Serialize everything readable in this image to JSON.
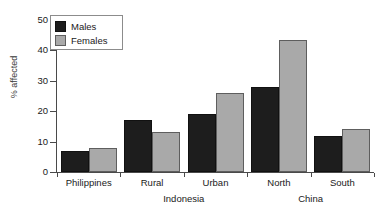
{
  "chart_data": {
    "type": "bar",
    "title": "",
    "xlabel": "",
    "ylabel": "% affected",
    "ylim": [
      0,
      50
    ],
    "yticks": [
      0,
      10,
      20,
      30,
      40,
      50
    ],
    "grid": false,
    "legend_position": "top-left",
    "categories": [
      "Philippines",
      "Rural",
      "Urban",
      "North",
      "South"
    ],
    "group_labels": [
      {
        "label": "Indonesia",
        "categories": [
          "Rural",
          "Urban"
        ]
      },
      {
        "label": "China",
        "categories": [
          "North",
          "South"
        ]
      }
    ],
    "series": [
      {
        "name": "Males",
        "color": "#1d1d1d",
        "values": [
          7,
          17,
          19,
          28,
          12
        ]
      },
      {
        "name": "Females",
        "color": "#a9a9a9",
        "values": [
          8,
          13,
          26,
          43.5,
          14.3
        ]
      }
    ]
  },
  "legend": {
    "items": [
      {
        "label": "Males",
        "swatch": "males-swatch"
      },
      {
        "label": "Females",
        "swatch": "females-swatch"
      }
    ]
  },
  "axes": {
    "y_label": "% affected",
    "y_tick_labels": [
      "50",
      "40",
      "30",
      "20",
      "10",
      "0"
    ]
  },
  "x_axis": {
    "category_labels": [
      "Philippines",
      "Rural",
      "Urban",
      "North",
      "South"
    ],
    "region_labels": [
      "Indonesia",
      "China"
    ]
  }
}
